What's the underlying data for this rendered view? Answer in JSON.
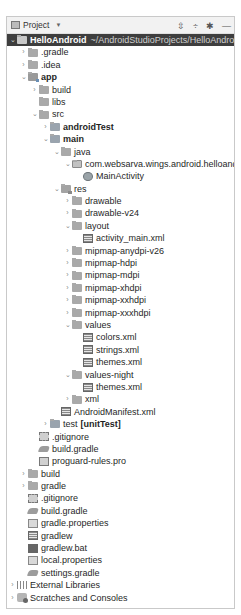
{
  "panel": {
    "title": "Project",
    "dropdown_icon": "chevron-down-icon",
    "actions": [
      {
        "name": "expand-all-button",
        "glyph": "⇳",
        "icon": "expand-all-icon"
      },
      {
        "name": "collapse-all-button",
        "glyph": "÷",
        "icon": "collapse-all-icon"
      },
      {
        "name": "settings-button",
        "glyph": "✱",
        "icon": "gear-icon"
      },
      {
        "name": "hide-button",
        "glyph": "—",
        "icon": "minus-icon"
      }
    ]
  },
  "tree": [
    {
      "label": "HelloAndroid",
      "suffix": " ~/AndroidStudioProjects/HelloAndroid",
      "depth": 0,
      "arrow": "open",
      "icon": "root",
      "bold": true,
      "selected": true
    },
    {
      "label": ".gradle",
      "depth": 1,
      "arrow": "closed",
      "icon": "folder"
    },
    {
      "label": ".idea",
      "depth": 1,
      "arrow": "closed",
      "icon": "folder"
    },
    {
      "label": "app",
      "depth": 1,
      "arrow": "open",
      "icon": "module",
      "bold": true
    },
    {
      "label": "build",
      "depth": 2,
      "arrow": "closed",
      "icon": "folder"
    },
    {
      "label": "libs",
      "depth": 2,
      "arrow": "none",
      "icon": "folder"
    },
    {
      "label": "src",
      "depth": 2,
      "arrow": "open",
      "icon": "folder"
    },
    {
      "label": "androidTest",
      "depth": 3,
      "arrow": "closed",
      "icon": "src",
      "bold": true
    },
    {
      "label": "main",
      "depth": 3,
      "arrow": "open",
      "icon": "src",
      "bold": true
    },
    {
      "label": "java",
      "depth": 4,
      "arrow": "open",
      "icon": "folder"
    },
    {
      "label": "com.websarva.wings.android.helloandroid",
      "depth": 5,
      "arrow": "open",
      "icon": "pkg"
    },
    {
      "label": "MainActivity",
      "depth": 6,
      "arrow": "none",
      "icon": "class"
    },
    {
      "label": "res",
      "depth": 4,
      "arrow": "open",
      "icon": "res"
    },
    {
      "label": "drawable",
      "depth": 5,
      "arrow": "closed",
      "icon": "folder"
    },
    {
      "label": "drawable-v24",
      "depth": 5,
      "arrow": "closed",
      "icon": "folder"
    },
    {
      "label": "layout",
      "depth": 5,
      "arrow": "open",
      "icon": "folder"
    },
    {
      "label": "activity_main.xml",
      "depth": 6,
      "arrow": "none",
      "icon": "xml"
    },
    {
      "label": "mipmap-anydpi-v26",
      "depth": 5,
      "arrow": "closed",
      "icon": "folder"
    },
    {
      "label": "mipmap-hdpi",
      "depth": 5,
      "arrow": "closed",
      "icon": "folder"
    },
    {
      "label": "mipmap-mdpi",
      "depth": 5,
      "arrow": "closed",
      "icon": "folder"
    },
    {
      "label": "mipmap-xhdpi",
      "depth": 5,
      "arrow": "closed",
      "icon": "folder"
    },
    {
      "label": "mipmap-xxhdpi",
      "depth": 5,
      "arrow": "closed",
      "icon": "folder"
    },
    {
      "label": "mipmap-xxxhdpi",
      "depth": 5,
      "arrow": "closed",
      "icon": "folder"
    },
    {
      "label": "values",
      "depth": 5,
      "arrow": "open",
      "icon": "folder"
    },
    {
      "label": "colors.xml",
      "depth": 6,
      "arrow": "none",
      "icon": "xml"
    },
    {
      "label": "strings.xml",
      "depth": 6,
      "arrow": "none",
      "icon": "xml"
    },
    {
      "label": "themes.xml",
      "depth": 6,
      "arrow": "none",
      "icon": "xml"
    },
    {
      "label": "values-night",
      "depth": 5,
      "arrow": "open",
      "icon": "folder"
    },
    {
      "label": "themes.xml",
      "depth": 6,
      "arrow": "none",
      "icon": "xml"
    },
    {
      "label": "xml",
      "depth": 5,
      "arrow": "closed",
      "icon": "folder"
    },
    {
      "label": "AndroidManifest.xml",
      "depth": 4,
      "arrow": "none",
      "icon": "xml"
    },
    {
      "label": "test",
      "suffix": "[unitTest]",
      "depth": 3,
      "arrow": "closed",
      "icon": "src"
    },
    {
      "label": ".gitignore",
      "depth": 2,
      "arrow": "none",
      "icon": "git"
    },
    {
      "label": "build.gradle",
      "depth": 2,
      "arrow": "none",
      "icon": "gradle"
    },
    {
      "label": "proguard-rules.pro",
      "depth": 2,
      "arrow": "none",
      "icon": "file"
    },
    {
      "label": "build",
      "depth": 1,
      "arrow": "closed",
      "icon": "folder"
    },
    {
      "label": "gradle",
      "depth": 1,
      "arrow": "closed",
      "icon": "folder"
    },
    {
      "label": ".gitignore",
      "depth": 1,
      "arrow": "none",
      "icon": "git"
    },
    {
      "label": "build.gradle",
      "depth": 1,
      "arrow": "none",
      "icon": "gradle"
    },
    {
      "label": "gradle.properties",
      "depth": 1,
      "arrow": "none",
      "icon": "prop"
    },
    {
      "label": "gradlew",
      "depth": 1,
      "arrow": "none",
      "icon": "xml"
    },
    {
      "label": "gradlew.bat",
      "depth": 1,
      "arrow": "none",
      "icon": "bat"
    },
    {
      "label": "local.properties",
      "depth": 1,
      "arrow": "none",
      "icon": "prop"
    },
    {
      "label": "settings.gradle",
      "depth": 1,
      "arrow": "none",
      "icon": "gradle"
    },
    {
      "label": "External Libraries",
      "depth": 0,
      "arrow": "closed",
      "icon": "lib"
    },
    {
      "label": "Scratches and Consoles",
      "depth": 0,
      "arrow": "closed",
      "icon": "scratch"
    }
  ],
  "glyphs": {
    "open": "⌄",
    "closed": "›",
    "none": ""
  }
}
